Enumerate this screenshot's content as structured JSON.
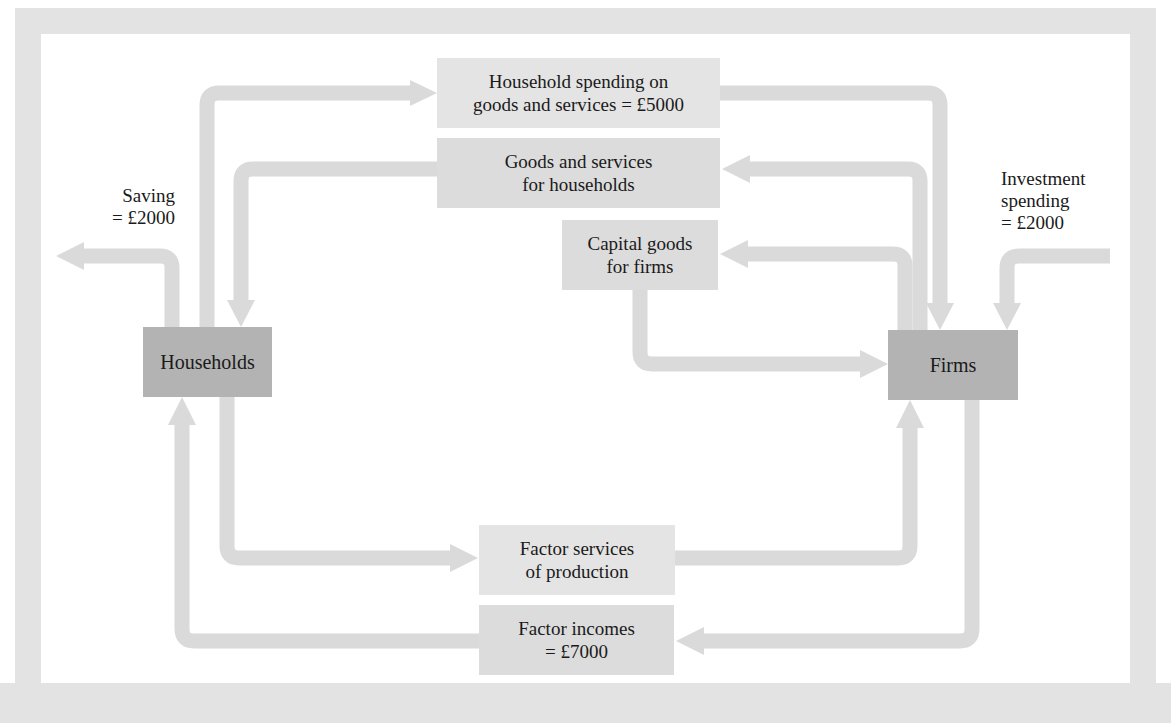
{
  "diagram": {
    "type": "circular-flow",
    "colors": {
      "frame": "#e2e2e2",
      "arrow": "#dadada",
      "label_box": "#e4e4e4",
      "sector_box": "#b3b3b3",
      "text": "#1a1a1a"
    },
    "sectors": {
      "households": {
        "label": "Households"
      },
      "firms": {
        "label": "Firms"
      }
    },
    "flows": {
      "household_spending": {
        "line1": "Household spending on",
        "line2": "goods and services = £5000"
      },
      "goods_services": {
        "line1": "Goods and services",
        "line2": "for households"
      },
      "capital_goods": {
        "line1": "Capital goods",
        "line2": "for firms"
      },
      "factor_services": {
        "line1": "Factor services",
        "line2": "of production"
      },
      "factor_incomes": {
        "line1": "Factor incomes",
        "line2": "= £7000"
      }
    },
    "leakages": {
      "saving": {
        "line1": "Saving",
        "line2": "= £2000"
      }
    },
    "injections": {
      "investment": {
        "line1": "Investment",
        "line2": "spending",
        "line3": "= £2000"
      }
    }
  }
}
